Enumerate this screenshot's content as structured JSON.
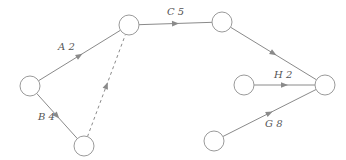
{
  "diagram": {
    "type": "activity-on-arrow network",
    "colors": {
      "line": "#8a8a8a",
      "node_stroke": "#9a9a9a",
      "label": "#555555"
    },
    "nodes": [
      {
        "id": "n1",
        "cx": 30,
        "cy": 86,
        "r": 10
      },
      {
        "id": "n2",
        "cx": 129,
        "cy": 25,
        "r": 10
      },
      {
        "id": "n3",
        "cx": 222,
        "cy": 22,
        "r": 10
      },
      {
        "id": "n4",
        "cx": 84,
        "cy": 146,
        "r": 10
      },
      {
        "id": "n5",
        "cx": 244,
        "cy": 85,
        "r": 10
      },
      {
        "id": "n6",
        "cx": 325,
        "cy": 85,
        "r": 10
      },
      {
        "id": "n7",
        "cx": 214,
        "cy": 141,
        "r": 10
      }
    ],
    "edges": [
      {
        "id": "A",
        "from": "n1",
        "to": "n2",
        "label": "A 2",
        "dashed": false,
        "lx": 58,
        "ly": 50
      },
      {
        "id": "B",
        "from": "n1",
        "to": "n4",
        "label": "B 4",
        "dashed": false,
        "lx": 38,
        "ly": 120
      },
      {
        "id": "dummy",
        "from": "n4",
        "to": "n2",
        "label": "",
        "dashed": true,
        "lx": 0,
        "ly": 0
      },
      {
        "id": "C",
        "from": "n2",
        "to": "n3",
        "label": "C 5",
        "dashed": false,
        "lx": 167,
        "ly": 15
      },
      {
        "id": "D",
        "from": "n3",
        "to": "n6",
        "label": "",
        "dashed": false,
        "lx": 0,
        "ly": 0
      },
      {
        "id": "H",
        "from": "n5",
        "to": "n6",
        "label": "H 2",
        "dashed": false,
        "lx": 274,
        "ly": 78
      },
      {
        "id": "G",
        "from": "n7",
        "to": "n6",
        "label": "G 8",
        "dashed": false,
        "lx": 265,
        "ly": 127
      }
    ]
  }
}
